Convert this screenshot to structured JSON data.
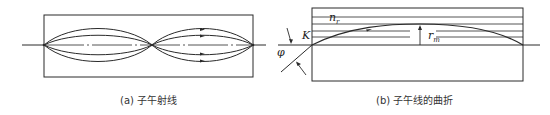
{
  "figure": {
    "panels": [
      {
        "id": "a",
        "caption": "(a) 子午射线",
        "description": "Meridional rays in a lens-like guide: ray bundles converge at periodic focal points along the axis",
        "num_ray_curves_per_period": 4,
        "periods": 2
      },
      {
        "id": "b",
        "caption": "(b) 子午线的曲折",
        "description": "Bending of a meridional ray in a graded-index medium",
        "labels": {
          "refractive_index": "n",
          "refractive_index_sub": "r",
          "entry_point": "K",
          "angle": "φ",
          "turning_radius": "r",
          "turning_radius_sub": "m"
        }
      }
    ]
  }
}
